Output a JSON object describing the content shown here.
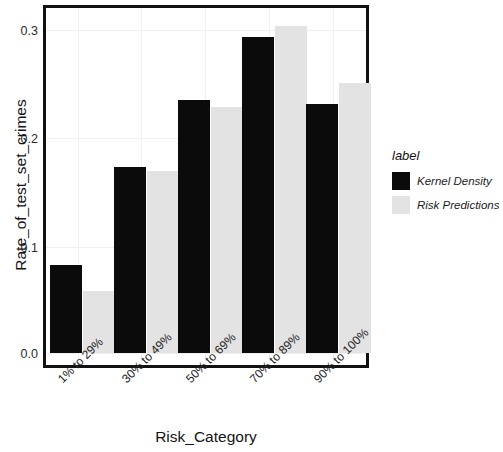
{
  "chart_data": {
    "type": "bar",
    "title": "",
    "subtitle": "",
    "xlabel": "Risk_Category",
    "ylabel": "Rate_of_test_set_crimes",
    "categories": [
      "1% to 29%",
      "30% to 49%",
      "50% to 69%",
      "70% to 89%",
      "90% to 100%"
    ],
    "series": [
      {
        "name": "Kernel Density",
        "color": "#0b0b0b",
        "values": [
          0.081,
          0.171,
          0.233,
          0.29,
          0.229
        ]
      },
      {
        "name": "Risk Predictions",
        "color": "#e3e3e3",
        "values": [
          0.057,
          0.167,
          0.226,
          0.301,
          0.248
        ]
      }
    ],
    "ylim": [
      0.0,
      0.315
    ],
    "yticks": [
      "0.0",
      "0.1",
      "0.2",
      "0.3"
    ],
    "ytick_values": [
      0.0,
      0.1,
      0.2,
      0.3
    ],
    "grid": true,
    "grid_axis": "both",
    "legend_position": "right",
    "legend_title": "label",
    "xtick_rotation": -45
  },
  "legend": {
    "title": "label",
    "entries": [
      {
        "label": "Kernel Density",
        "color": "#0b0b0b"
      },
      {
        "label": "Risk Predictions",
        "color": "#e3e3e3"
      }
    ]
  },
  "axes": {
    "y_title": "Rate_of_test_set_crimes",
    "x_title": "Risk_Category",
    "y_ticks": [
      "0.3",
      "0.2",
      "0.1",
      "0.0"
    ],
    "x_ticks": [
      "1% to 29%",
      "30% to 49%",
      "50% to 69%",
      "70% to 89%",
      "90% to 100%"
    ]
  }
}
